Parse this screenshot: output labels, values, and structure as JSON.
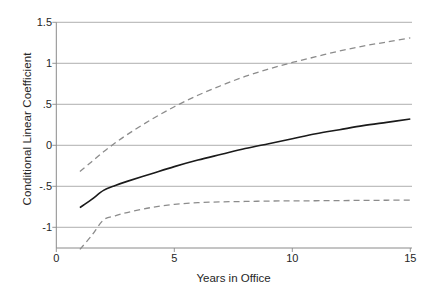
{
  "chart_data": {
    "type": "line",
    "title": "",
    "xlabel": "Years in Office",
    "ylabel": "Conditional Linear Coefficient",
    "xlim": [
      0,
      15
    ],
    "ylim": [
      -1.3,
      1.5
    ],
    "grid": true,
    "grid_axis": "y",
    "legend": "none",
    "xticks": [
      0,
      5,
      10,
      15
    ],
    "xticklabels": [
      "0",
      "5",
      "10",
      "15"
    ],
    "yticks": [
      1.5,
      1,
      0.5,
      0,
      -0.5,
      -1
    ],
    "yticklabels": [
      "1.5",
      "1",
      ".5",
      "0",
      "-.5",
      "-1"
    ],
    "x": [
      1,
      1.5,
      2,
      2.5,
      3,
      4,
      5,
      6,
      7,
      8,
      9,
      10,
      11,
      12,
      13,
      14,
      15
    ],
    "series": [
      {
        "name": "Upper 95% confidence bound",
        "style": "dashed",
        "color": "#8c8c8c",
        "values": [
          -0.32,
          -0.2,
          -0.08,
          0.03,
          0.13,
          0.31,
          0.47,
          0.61,
          0.73,
          0.84,
          0.93,
          1.01,
          1.08,
          1.15,
          1.21,
          1.26,
          1.31
        ]
      },
      {
        "name": "Conditional linear coefficient (point estimate)",
        "style": "solid",
        "color": "#1a1a1a",
        "values": [
          -0.76,
          -0.66,
          -0.55,
          -0.49,
          -0.44,
          -0.35,
          -0.26,
          -0.18,
          -0.11,
          -0.04,
          0.02,
          0.08,
          0.14,
          0.19,
          0.24,
          0.28,
          0.32
        ]
      },
      {
        "name": "Lower 95% confidence bound",
        "style": "dashed",
        "color": "#8c8c8c",
        "values": [
          -1.27,
          -1.1,
          -0.91,
          -0.86,
          -0.82,
          -0.76,
          -0.72,
          -0.7,
          -0.69,
          -0.685,
          -0.68,
          -0.678,
          -0.676,
          -0.674,
          -0.672,
          -0.67,
          -0.668
        ]
      }
    ]
  }
}
